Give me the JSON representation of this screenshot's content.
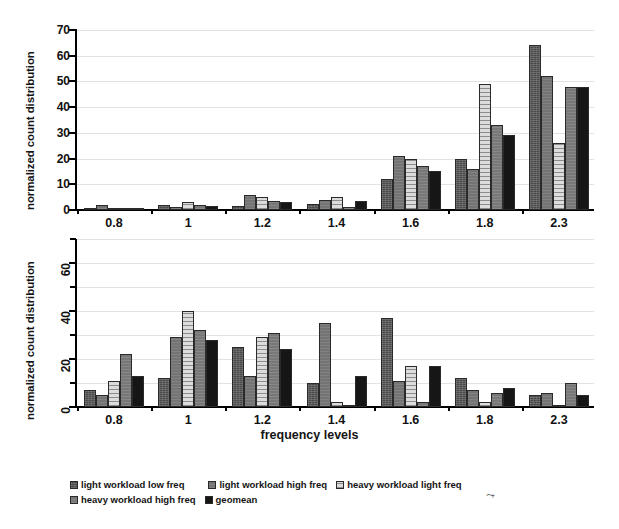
{
  "figure": {
    "xaxis_title": "frequency levels",
    "ylabel": "normalized count distribution",
    "stray_mark": "⤳"
  },
  "legend": {
    "items": [
      {
        "label": "light workload low freq",
        "series_key": "light_low",
        "color": "#4a4a4a",
        "pattern": "dark-noise"
      },
      {
        "label": "light workload high freq",
        "series_key": "light_high",
        "color": "#747474",
        "pattern": "mid-grey"
      },
      {
        "label": "heavy workload light freq",
        "series_key": "heavy_light",
        "color": "#dcdcdc",
        "pattern": "horizontal-lines"
      },
      {
        "label": "heavy workload high freq",
        "series_key": "heavy_high",
        "color": "#787878",
        "pattern": "mid-grey"
      },
      {
        "label": "geomean",
        "series_key": "geomean",
        "color": "#161616",
        "pattern": "solid-black"
      }
    ]
  },
  "chart_data": [
    {
      "id": "top",
      "type": "bar",
      "title": "",
      "xlabel": "frequency levels",
      "ylabel": "normalized count distribution",
      "categories": [
        "0.8",
        "1",
        "1.2",
        "1.4",
        "1.6",
        "1.8",
        "2.3"
      ],
      "ylim": [
        0,
        70
      ],
      "yticks": [
        0,
        10,
        20,
        30,
        40,
        50,
        60,
        70
      ],
      "ytick_labels": [
        "0",
        "10",
        "20",
        "30",
        "40",
        "50",
        "60",
        "70"
      ],
      "grid": true,
      "legend_position": "below-figure",
      "series": [
        {
          "name": "light workload low freq",
          "values": [
            0.5,
            2.0,
            1.5,
            2.5,
            12.0,
            20.0,
            64.0
          ]
        },
        {
          "name": "light workload high freq",
          "values": [
            2.0,
            1.0,
            6.0,
            4.0,
            21.0,
            16.0,
            52.0
          ]
        },
        {
          "name": "heavy workload light freq",
          "values": [
            0.5,
            3.0,
            5.0,
            5.0,
            20.0,
            49.0,
            26.0
          ]
        },
        {
          "name": "heavy workload high freq",
          "values": [
            0.5,
            2.0,
            3.5,
            1.0,
            17.0,
            33.0,
            48.0
          ]
        },
        {
          "name": "geomean",
          "values": [
            0.5,
            1.5,
            3.0,
            3.5,
            15.0,
            29.0,
            48.0
          ]
        }
      ]
    },
    {
      "id": "bottom",
      "type": "bar",
      "title": "",
      "xlabel": "frequency levels",
      "ylabel": "normalized count distribution",
      "categories": [
        "0.8",
        "1",
        "1.2",
        "1.4",
        "1.6",
        "1.8",
        "2.3"
      ],
      "ylim": [
        0,
        70
      ],
      "yticks": [
        0,
        10,
        20,
        30,
        40,
        50,
        60,
        70
      ],
      "ytick_labels": [
        "0",
        "",
        "20",
        "",
        "40",
        "",
        "60",
        ""
      ],
      "grid": true,
      "legend_position": "below-figure",
      "series": [
        {
          "name": "light workload low freq",
          "values": [
            7.0,
            12.0,
            25.0,
            10.0,
            37.0,
            12.0,
            5.0
          ]
        },
        {
          "name": "light workload high freq",
          "values": [
            5.0,
            29.0,
            13.0,
            35.0,
            11.0,
            7.0,
            6.0
          ]
        },
        {
          "name": "heavy workload light freq",
          "values": [
            11.0,
            40.0,
            29.0,
            2.0,
            17.0,
            2.0,
            1.0
          ]
        },
        {
          "name": "heavy workload high freq",
          "values": [
            22.0,
            32.0,
            31.0,
            0.5,
            2.0,
            6.0,
            10.0
          ]
        },
        {
          "name": "geomean",
          "values": [
            13.0,
            28.0,
            24.0,
            13.0,
            17.0,
            8.0,
            5.0
          ]
        }
      ]
    }
  ]
}
